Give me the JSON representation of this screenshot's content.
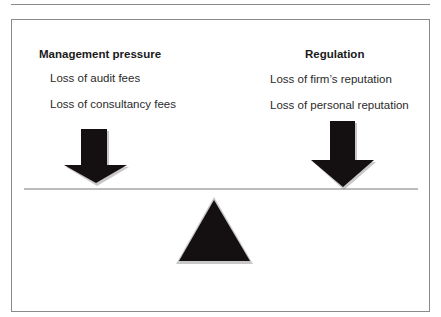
{
  "diagram": {
    "left_group": {
      "heading": "Management pressure",
      "items": [
        "Loss of audit fees",
        "Loss of consultancy fees"
      ]
    },
    "right_group": {
      "heading": "Regulation",
      "items": [
        "Loss of firm’s reputation",
        "Loss of personal reputation"
      ]
    },
    "colors": {
      "shape_fill": "#140f10",
      "shape_shadow": "#c8c8c8",
      "line": "#7a7a7a",
      "frame": "#8a8a8a"
    }
  }
}
